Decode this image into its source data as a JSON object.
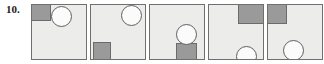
{
  "exercise": {
    "number_label": "10.",
    "panel_count": 5,
    "panel_size_px": 56,
    "colors": {
      "panel_fill": "#ececeb",
      "panel_border": "#6f6f6f",
      "square_fill": "#9a9a9a",
      "square_border": "#6b6b6b",
      "circle_fill": "#fbfbfb",
      "circle_border": "#5f5f5f",
      "number_text": "#1a1a1a",
      "page_background": "#ffffff"
    }
  },
  "panels": [
    {
      "index": 1,
      "name": "panel-1",
      "square": {
        "label": "gray-square",
        "position": "top-left",
        "x": 0,
        "y": 0,
        "width": 19,
        "height": 16
      },
      "circle": {
        "label": "white-circle",
        "position": "top-left-of-center",
        "cx": 30,
        "cy": 12,
        "diameter": 21
      }
    },
    {
      "index": 2,
      "name": "panel-2",
      "square": {
        "label": "gray-square",
        "position": "bottom-left",
        "x": 2,
        "y": 37,
        "width": 18,
        "height": 18
      },
      "circle": {
        "label": "white-circle",
        "position": "top-right",
        "cx": 41,
        "cy": 11,
        "diameter": 21
      }
    },
    {
      "index": 3,
      "name": "panel-3",
      "square": {
        "label": "gray-square",
        "position": "bottom-right",
        "x": 26,
        "y": 38,
        "width": 20,
        "height": 18
      },
      "circle": {
        "label": "white-circle",
        "position": "center-right",
        "cx": 36,
        "cy": 30,
        "diameter": 21
      }
    },
    {
      "index": 4,
      "name": "panel-4",
      "square": {
        "label": "gray-square",
        "position": "top-right",
        "x": 29,
        "y": 0,
        "width": 27,
        "height": 19
      },
      "circle": {
        "label": "white-circle",
        "position": "bottom-right",
        "cx": 37,
        "cy": 52,
        "diameter": 21
      }
    },
    {
      "index": 5,
      "name": "panel-5",
      "square": {
        "label": "gray-square",
        "position": "top-left",
        "x": 0,
        "y": 0,
        "width": 19,
        "height": 19
      },
      "circle": {
        "label": "white-circle",
        "position": "bottom-center",
        "cx": 25,
        "cy": 50,
        "diameter": 21
      }
    }
  ]
}
